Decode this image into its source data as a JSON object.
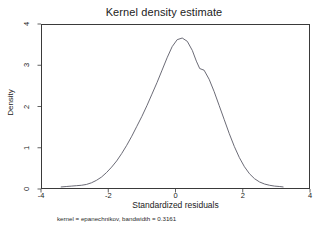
{
  "chart_data": {
    "type": "line",
    "title": "Kernel density estimate",
    "xlabel": "Standardized residuals",
    "ylabel": "Density",
    "note": "kernel = epanechnikov, bandwidth = 0.3161",
    "xlim": [
      -4,
      4
    ],
    "ylim": [
      0,
      4
    ],
    "xticks": [
      -4,
      -2,
      0,
      2,
      4
    ],
    "xtick_labels": [
      "-4",
      "-2",
      "0",
      "2",
      "4"
    ],
    "yticks": [
      0,
      1,
      2,
      3,
      4
    ],
    "ytick_labels": [
      "0",
      "1",
      "2",
      "3",
      "4"
    ],
    "grid": false,
    "legend": false,
    "line_color": "#5a5a66",
    "line_width": 0.9,
    "series": [
      {
        "name": "Density",
        "x": [
          -3.4,
          -3.25,
          -3.1,
          -2.95,
          -2.8,
          -2.65,
          -2.5,
          -2.35,
          -2.2,
          -2.05,
          -1.9,
          -1.75,
          -1.6,
          -1.45,
          -1.3,
          -1.15,
          -1.0,
          -0.85,
          -0.7,
          -0.55,
          -0.4,
          -0.25,
          -0.1,
          0.05,
          0.2,
          0.35,
          0.5,
          0.62,
          0.72,
          0.85,
          1.0,
          1.15,
          1.3,
          1.45,
          1.6,
          1.75,
          1.9,
          2.05,
          2.2,
          2.35,
          2.5,
          2.65,
          2.8,
          2.95,
          3.1,
          3.2
        ],
        "y": [
          0.05,
          0.06,
          0.07,
          0.08,
          0.09,
          0.11,
          0.15,
          0.21,
          0.29,
          0.4,
          0.53,
          0.68,
          0.86,
          1.06,
          1.28,
          1.52,
          1.76,
          2.02,
          2.3,
          2.58,
          2.88,
          3.18,
          3.45,
          3.62,
          3.66,
          3.58,
          3.36,
          3.1,
          2.92,
          2.88,
          2.66,
          2.36,
          2.02,
          1.68,
          1.34,
          1.03,
          0.76,
          0.54,
          0.37,
          0.25,
          0.17,
          0.12,
          0.09,
          0.07,
          0.06,
          0.05
        ]
      }
    ]
  },
  "figure": {
    "title": "Kernel density estimate",
    "xlabel": "Standardized residuals",
    "ylabel": "Density",
    "footnote": "kernel = epanechnikov, bandwidth = 0.3161"
  }
}
